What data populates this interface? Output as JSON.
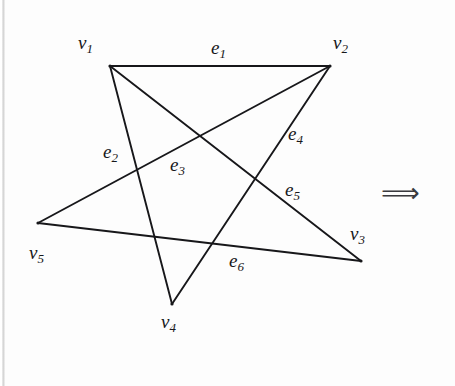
{
  "figure": {
    "background_color": "#fdfdfd",
    "ink_color": "#17171a",
    "stroke_width": 1.9
  },
  "vertices": [
    {
      "id": "v1",
      "label_base": "v",
      "label_sub": "1",
      "x": 110,
      "y": 66,
      "label_x": 78,
      "label_y": 33
    },
    {
      "id": "v2",
      "label_base": "v",
      "label_sub": "2",
      "x": 330,
      "y": 66,
      "label_x": 333,
      "label_y": 33
    },
    {
      "id": "v3",
      "label_base": "v",
      "label_sub": "3",
      "x": 361,
      "y": 261,
      "label_x": 350,
      "label_y": 224
    },
    {
      "id": "v4",
      "label_base": "v",
      "label_sub": "4",
      "x": 172,
      "y": 304,
      "label_x": 161,
      "label_y": 312
    },
    {
      "id": "v5",
      "label_base": "v",
      "label_sub": "5",
      "x": 38,
      "y": 223,
      "label_x": 29,
      "label_y": 243
    }
  ],
  "edges": [
    {
      "id": "e1",
      "label_base": "e",
      "label_sub": "1",
      "from": "v1",
      "to": "v2",
      "label_x": 211,
      "label_y": 38
    },
    {
      "id": "e2",
      "label_base": "e",
      "label_sub": "2",
      "from": "v1",
      "to": "v4",
      "label_x": 103,
      "label_y": 142
    },
    {
      "id": "e3",
      "label_base": "e",
      "label_sub": "3",
      "from": "v5",
      "to": "v2",
      "label_x": 170,
      "label_y": 155
    },
    {
      "id": "e4",
      "label_base": "e",
      "label_sub": "4",
      "from": "v2",
      "to": "v4",
      "label_x": 288,
      "label_y": 124
    },
    {
      "id": "e5",
      "label_base": "e",
      "label_sub": "5",
      "from": "v1",
      "to": "v3",
      "label_x": 285,
      "label_y": 180
    },
    {
      "id": "e6",
      "label_base": "e",
      "label_sub": "6",
      "from": "v5",
      "to": "v3",
      "label_x": 229,
      "label_y": 251
    }
  ],
  "annotations": {
    "implies_arrow": "⟹",
    "implies_arrow_x": 381,
    "implies_arrow_y": 179
  }
}
